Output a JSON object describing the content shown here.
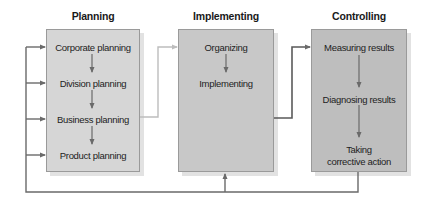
{
  "diagram": {
    "columns": [
      {
        "title": "Planning",
        "fill": "#d6d6d6",
        "steps": [
          "Corporate planning",
          "Division planning",
          "Business planning",
          "Product planning"
        ]
      },
      {
        "title": "Implementing",
        "fill": "#c8c8c8",
        "steps": [
          "Organizing",
          "Implementing"
        ]
      },
      {
        "title": "Controlling",
        "fill": "#bebebe",
        "steps": [
          "Measuring results",
          "Diagnosing results",
          "Taking corrective action"
        ]
      }
    ],
    "colors": {
      "line_dark": "#6a6a6a",
      "line_light": "#bdbdbd",
      "shadow": "#e2e2e2"
    }
  }
}
